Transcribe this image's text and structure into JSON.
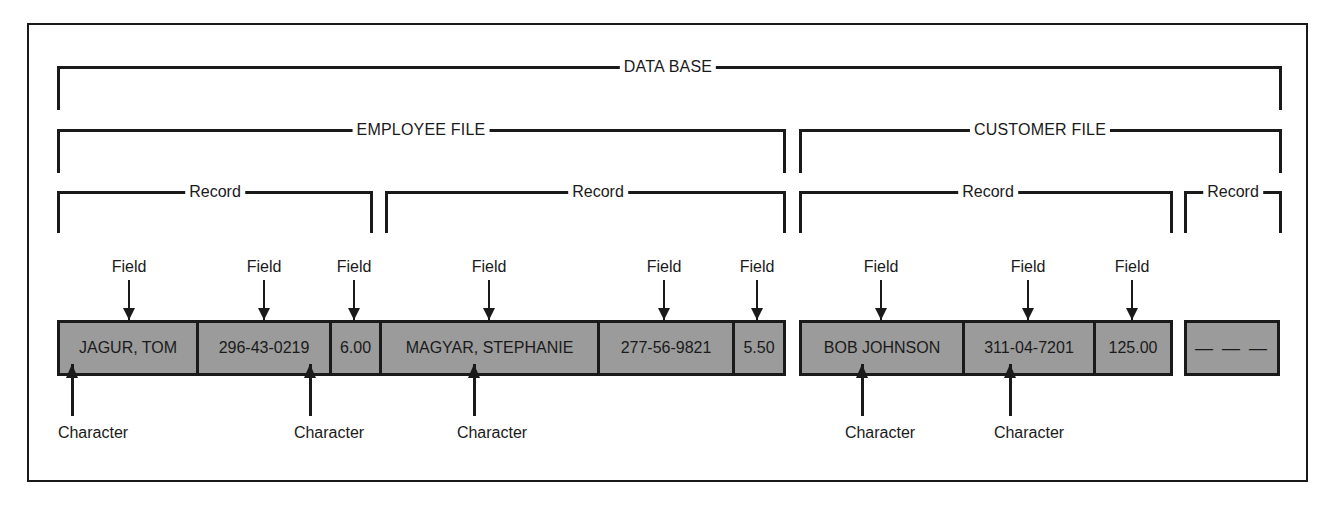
{
  "diagram": {
    "database_label": "DATA BASE",
    "files": [
      {
        "label": "EMPLOYEE FILE"
      },
      {
        "label": "CUSTOMER FILE"
      }
    ],
    "record_label": "Record",
    "field_label": "Field",
    "character_label": "Character",
    "records": [
      {
        "file": "EMPLOYEE FILE",
        "fields": [
          "JAGUR, TOM",
          "296-43-0219",
          "6.00"
        ]
      },
      {
        "file": "EMPLOYEE FILE",
        "fields": [
          "MAGYAR, STEPHANIE",
          "277-56-9821",
          "5.50"
        ]
      },
      {
        "file": "CUSTOMER FILE",
        "fields": [
          "BOB JOHNSON",
          "311-04-7201",
          "125.00"
        ]
      },
      {
        "file": "CUSTOMER FILE",
        "fields": [
          "— — —"
        ]
      }
    ],
    "colors": {
      "cell_fill": "#9b9b9b",
      "line": "#1a1a1a"
    }
  }
}
